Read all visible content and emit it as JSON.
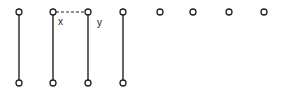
{
  "diagram": {
    "colors": {
      "stroke": "#222222",
      "background": "#ffffff"
    },
    "top_nodes": [
      {
        "id": "t1",
        "x": 19,
        "y": 12
      },
      {
        "id": "t2",
        "x": 53,
        "y": 12,
        "label": "x"
      },
      {
        "id": "t3",
        "x": 88,
        "y": 12,
        "label": "y"
      },
      {
        "id": "t4",
        "x": 123,
        "y": 12
      },
      {
        "id": "t5",
        "x": 160,
        "y": 12
      },
      {
        "id": "t6",
        "x": 193,
        "y": 12
      },
      {
        "id": "t7",
        "x": 229,
        "y": 12
      },
      {
        "id": "t8",
        "x": 264,
        "y": 12
      }
    ],
    "bottom_nodes": [
      {
        "id": "b1",
        "x": 19,
        "y": 83
      },
      {
        "id": "b2",
        "x": 53,
        "y": 83
      },
      {
        "id": "b3",
        "x": 88,
        "y": 83
      },
      {
        "id": "b4",
        "x": 123,
        "y": 83
      }
    ],
    "labels": {
      "x": "x",
      "y": "y"
    }
  }
}
